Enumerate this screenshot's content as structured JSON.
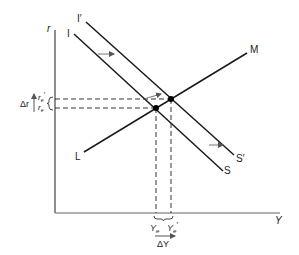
{
  "diagram": {
    "type": "IS-LM",
    "axes": {
      "y_label": "r",
      "x_label": "Y"
    },
    "curves": {
      "is_original": {
        "top_label": "I",
        "bottom_label": "S"
      },
      "is_shifted": {
        "top_label": "I′",
        "bottom_label": "S′"
      },
      "lm": {
        "start_label": "L",
        "end_label": "M"
      }
    },
    "equilibria": {
      "r_original": "r",
      "r_original_sub": "e",
      "r_new": "r",
      "r_new_sub": "e",
      "r_new_prime": "′",
      "y_original": "Y",
      "y_original_sub": "e",
      "y_new": "Y",
      "y_new_sub": "e",
      "y_new_prime": "′"
    },
    "changes": {
      "delta_r": "Δr",
      "delta_y": "ΔY"
    },
    "colors": {
      "line": "#1a1a1a",
      "arrow": "#777777",
      "axis": "#555555"
    }
  }
}
